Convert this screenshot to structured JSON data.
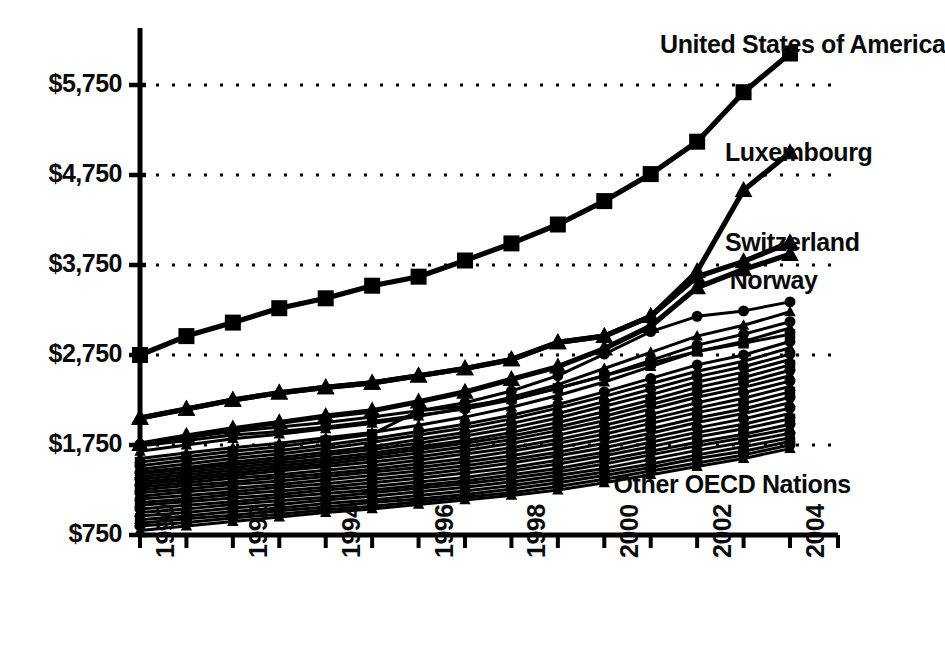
{
  "chart_data": {
    "type": "line",
    "title": "",
    "subtitle": "",
    "xlabel": "",
    "ylabel": "",
    "xlim": [
      1990,
      2004
    ],
    "ylim": [
      750,
      6250
    ],
    "grid": true,
    "grid_axis": "y",
    "legend_position": "inline-annotations",
    "x": [
      1990,
      1991,
      1992,
      1993,
      1994,
      1995,
      1996,
      1997,
      1998,
      1999,
      2000,
      2001,
      2002,
      2003,
      2004
    ],
    "y_ticks": [
      750,
      1750,
      2750,
      3750,
      4750,
      5750
    ],
    "y_tick_labels": [
      "$750",
      "$1,750",
      "$2,750",
      "$3,750",
      "$4,750",
      "$5,750"
    ],
    "x_ticks": [
      1990,
      1991,
      1992,
      1993,
      1994,
      1995,
      1996,
      1997,
      1998,
      1999,
      2000,
      2001,
      2002,
      2003,
      2004
    ],
    "x_tick_labels": [
      "1990",
      "",
      "1992",
      "",
      "1994",
      "",
      "1996",
      "",
      "1998",
      "",
      "2000",
      "",
      "2002",
      "",
      "2004"
    ],
    "x_tick_labels_shown": [
      "1990",
      "1992",
      "1994",
      "1996",
      "1998",
      "2000",
      "2002",
      "2004"
    ],
    "annotations": [
      {
        "text": "United States of America",
        "x": 2001.2,
        "y": 6180
      },
      {
        "text": "Luxembourg",
        "x": 2002.6,
        "y": 4980
      },
      {
        "text": "Switzerland",
        "x": 2002.6,
        "y": 3980
      },
      {
        "text": "Norway",
        "x": 2002.7,
        "y": 3560
      },
      {
        "text": "Other OECD Nations",
        "x": 2000.2,
        "y": 1300
      }
    ],
    "series": [
      {
        "name": "United States of America",
        "marker": "square",
        "emphasis": "high",
        "values": [
          2750,
          2960,
          3110,
          3270,
          3380,
          3520,
          3620,
          3800,
          3990,
          4200,
          4460,
          4760,
          5120,
          5670,
          6100
        ]
      },
      {
        "name": "Luxembourg",
        "marker": "triangle",
        "emphasis": "high",
        "values": [
          2050,
          2150,
          2250,
          2330,
          2390,
          2440,
          2520,
          2600,
          2700,
          2890,
          2960,
          3180,
          3680,
          4580,
          5000
        ]
      },
      {
        "name": "Switzerland",
        "marker": "triangle",
        "emphasis": "high",
        "values": [
          2050,
          2150,
          2250,
          2330,
          2390,
          2440,
          2520,
          2600,
          2700,
          2890,
          2960,
          3180,
          3620,
          3790,
          4000
        ]
      },
      {
        "name": "Norway",
        "marker": "triangle",
        "emphasis": "high",
        "values": [
          1760,
          1850,
          1930,
          2000,
          2070,
          2130,
          2230,
          2340,
          2480,
          2620,
          2820,
          3070,
          3500,
          3700,
          3870
        ]
      },
      {
        "name": "Other OECD Nation 1",
        "marker": "circle",
        "emphasis": "band",
        "values": [
          1760,
          1830,
          1900,
          1950,
          2000,
          2060,
          2130,
          2220,
          2350,
          2520,
          2760,
          3010,
          3180,
          3240,
          3340
        ]
      },
      {
        "name": "Other OECD Nation 2",
        "marker": "triangle",
        "emphasis": "band",
        "values": [
          1680,
          1750,
          1820,
          1870,
          1930,
          1990,
          2070,
          2160,
          2280,
          2420,
          2600,
          2780,
          2960,
          3080,
          3230
        ]
      },
      {
        "name": "Other OECD Nation 3",
        "marker": "circle",
        "emphasis": "band",
        "values": [
          1740,
          1800,
          1860,
          1900,
          1950,
          2010,
          2080,
          2150,
          2250,
          2380,
          2520,
          2690,
          2860,
          2980,
          3120
        ]
      },
      {
        "name": "Other OECD Nation 4",
        "marker": "triangle",
        "emphasis": "band",
        "values": [
          1600,
          1660,
          1720,
          1770,
          1830,
          1890,
          1970,
          2060,
          2170,
          2300,
          2450,
          2620,
          2790,
          2900,
          3050
        ]
      },
      {
        "name": "Other OECD Nation 5",
        "marker": "square",
        "emphasis": "band",
        "values": [
          1560,
          1620,
          1680,
          1730,
          1800,
          1870,
          2130,
          2180,
          2260,
          2380,
          2520,
          2660,
          2790,
          2880,
          2980
        ]
      },
      {
        "name": "Other OECD Nation 6",
        "marker": "circle",
        "emphasis": "band",
        "values": [
          1520,
          1580,
          1640,
          1690,
          1750,
          1820,
          1900,
          1980,
          2080,
          2200,
          2340,
          2490,
          2640,
          2750,
          2900
        ]
      },
      {
        "name": "Other OECD Nation 7",
        "marker": "triangle",
        "emphasis": "band",
        "values": [
          1480,
          1540,
          1600,
          1650,
          1710,
          1780,
          1860,
          1940,
          2040,
          2160,
          2290,
          2430,
          2570,
          2680,
          2830
        ]
      },
      {
        "name": "Other OECD Nation 8",
        "marker": "circle",
        "emphasis": "band",
        "values": [
          1450,
          1500,
          1560,
          1610,
          1670,
          1730,
          1810,
          1890,
          1990,
          2100,
          2230,
          2370,
          2510,
          2620,
          2760
        ]
      },
      {
        "name": "Other OECD Nation 9",
        "marker": "triangle",
        "emphasis": "band",
        "values": [
          1430,
          1480,
          1530,
          1580,
          1640,
          1700,
          1770,
          1850,
          1940,
          2050,
          2180,
          2310,
          2450,
          2560,
          2700
        ]
      },
      {
        "name": "Other OECD Nation 10",
        "marker": "square",
        "emphasis": "band",
        "values": [
          1400,
          1450,
          1500,
          1550,
          1600,
          1660,
          1730,
          1800,
          1890,
          2000,
          2120,
          2250,
          2390,
          2500,
          2640
        ]
      },
      {
        "name": "Other OECD Nation 11",
        "marker": "circle",
        "emphasis": "band",
        "values": [
          1370,
          1420,
          1470,
          1520,
          1570,
          1630,
          1700,
          1770,
          1850,
          1950,
          2070,
          2200,
          2330,
          2440,
          2580
        ]
      },
      {
        "name": "Other OECD Nation 12",
        "marker": "triangle",
        "emphasis": "band",
        "values": [
          1340,
          1390,
          1440,
          1490,
          1540,
          1600,
          1660,
          1730,
          1810,
          1910,
          2020,
          2150,
          2280,
          2390,
          2520
        ]
      },
      {
        "name": "Other OECD Nation 13",
        "marker": "circle",
        "emphasis": "band",
        "values": [
          1310,
          1360,
          1410,
          1460,
          1510,
          1560,
          1620,
          1690,
          1770,
          1860,
          1970,
          2090,
          2220,
          2330,
          2460
        ]
      },
      {
        "name": "Other OECD Nation 14",
        "marker": "triangle",
        "emphasis": "band",
        "values": [
          1280,
          1330,
          1380,
          1420,
          1470,
          1520,
          1580,
          1650,
          1720,
          1810,
          1920,
          2040,
          2160,
          2270,
          2400
        ]
      },
      {
        "name": "Other OECD Nation 15",
        "marker": "square",
        "emphasis": "band",
        "values": [
          1250,
          1300,
          1340,
          1390,
          1430,
          1480,
          1540,
          1600,
          1680,
          1770,
          1870,
          1990,
          2110,
          2210,
          2340
        ]
      },
      {
        "name": "Other OECD Nation 16",
        "marker": "circle",
        "emphasis": "band",
        "values": [
          1220,
          1260,
          1310,
          1350,
          1400,
          1450,
          1500,
          1560,
          1630,
          1720,
          1820,
          1930,
          2050,
          2150,
          2280
        ]
      },
      {
        "name": "Other OECD Nation 17",
        "marker": "triangle",
        "emphasis": "band",
        "values": [
          1180,
          1230,
          1270,
          1310,
          1360,
          1410,
          1460,
          1520,
          1590,
          1670,
          1770,
          1880,
          2000,
          2100,
          2220
        ]
      },
      {
        "name": "Other OECD Nation 18",
        "marker": "circle",
        "emphasis": "band",
        "values": [
          1150,
          1190,
          1230,
          1280,
          1320,
          1370,
          1420,
          1480,
          1550,
          1630,
          1720,
          1830,
          1940,
          2040,
          2160
        ]
      },
      {
        "name": "Other OECD Nation 19",
        "marker": "triangle",
        "emphasis": "band",
        "values": [
          1110,
          1150,
          1200,
          1240,
          1280,
          1330,
          1380,
          1440,
          1500,
          1580,
          1670,
          1780,
          1890,
          1980,
          2100
        ]
      },
      {
        "name": "Other OECD Nation 20",
        "marker": "square",
        "emphasis": "band",
        "values": [
          1080,
          1120,
          1160,
          1200,
          1250,
          1290,
          1340,
          1390,
          1460,
          1540,
          1630,
          1730,
          1840,
          1930,
          2040
        ]
      },
      {
        "name": "Other OECD Nation 21",
        "marker": "circle",
        "emphasis": "band",
        "values": [
          1040,
          1080,
          1120,
          1170,
          1210,
          1250,
          1300,
          1350,
          1420,
          1490,
          1580,
          1680,
          1780,
          1870,
          1980
        ]
      },
      {
        "name": "Other OECD Nation 22",
        "marker": "triangle",
        "emphasis": "band",
        "values": [
          1000,
          1040,
          1090,
          1130,
          1170,
          1220,
          1270,
          1320,
          1380,
          1450,
          1540,
          1640,
          1740,
          1830,
          1930
        ]
      },
      {
        "name": "Other OECD Nation 23",
        "marker": "circle",
        "emphasis": "band",
        "values": [
          960,
          1000,
          1050,
          1090,
          1140,
          1180,
          1230,
          1280,
          1340,
          1410,
          1490,
          1590,
          1690,
          1780,
          1880
        ]
      },
      {
        "name": "Other OECD Nation 24",
        "marker": "triangle",
        "emphasis": "band",
        "values": [
          920,
          960,
          1010,
          1050,
          1100,
          1140,
          1190,
          1240,
          1300,
          1370,
          1450,
          1540,
          1640,
          1730,
          1830
        ]
      },
      {
        "name": "Other OECD Nation 25",
        "marker": "square",
        "emphasis": "band",
        "values": [
          880,
          930,
          970,
          1020,
          1060,
          1110,
          1150,
          1200,
          1260,
          1330,
          1410,
          1500,
          1600,
          1680,
          1790
        ]
      },
      {
        "name": "Other OECD Nation 26",
        "marker": "circle",
        "emphasis": "band",
        "values": [
          850,
          890,
          940,
          980,
          1030,
          1070,
          1120,
          1170,
          1220,
          1290,
          1370,
          1460,
          1550,
          1640,
          1750
        ]
      },
      {
        "name": "Other OECD Nation 27",
        "marker": "triangle",
        "emphasis": "band",
        "values": [
          800,
          850,
          900,
          950,
          1000,
          1040,
          1090,
          1140,
          1190,
          1250,
          1330,
          1420,
          1510,
          1600,
          1710
        ]
      }
    ],
    "style": {
      "line_color": "#000000",
      "grid_color": "#000000",
      "grid_style": "dotted",
      "background": "#ffffff"
    }
  },
  "axes": {
    "y_axis_name": "y-axis",
    "x_axis_name": "x-axis"
  }
}
